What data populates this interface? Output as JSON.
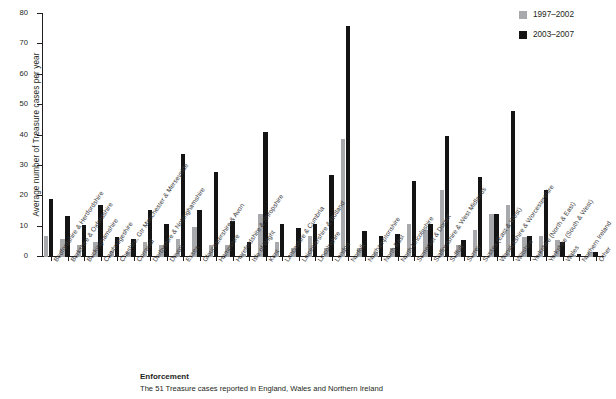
{
  "chart_data": {
    "type": "bar",
    "title": "",
    "xlabel": "",
    "ylabel": "Average number of Treasure cases per year",
    "ylim": [
      0,
      80
    ],
    "yticks": [
      0,
      10,
      20,
      30,
      40,
      50,
      60,
      70,
      80
    ],
    "grid": false,
    "legend_position": "top-right",
    "categories": [
      "Bedfordshire & Hertfordshire",
      "Berkshire & Oxfordshire",
      "Buckinghamshire",
      "Cambridgeshire",
      "Cheshire, Gtr Manchester & Merseyside",
      "Cornwall",
      "Derbyshire & Nottinghamshire",
      "Devon",
      "Essex",
      "Gloucestershire & Avon",
      "Hampshire",
      "Herefordshire & Shropshire",
      "Isle of Wight",
      "Kent",
      "Lancashire & Cumbria",
      "Leicestershire & Rutland",
      "Lincolnshire",
      "London",
      "Norfolk",
      "Northamptonshire",
      "North East",
      "North Lincolnshire",
      "Somerset & Dorset",
      "Staffordshire & West Midlands",
      "Suffolk",
      "Surrey",
      "Sussex (East & West)",
      "Warwickshire & Worcestershire",
      "Wiltshire",
      "Yorkshire (North & East)",
      "Yorkshire (South & West)",
      "Wales",
      "Northern Ireland",
      "Other"
    ],
    "series": [
      {
        "name": "1997–2002",
        "color": "#a7a9ac",
        "values": [
          7,
          6,
          4,
          5,
          2,
          1.5,
          5,
          4,
          6,
          10,
          4,
          4,
          1,
          14,
          5,
          3,
          7,
          3,
          39,
          3,
          1.5,
          3,
          11,
          9,
          22,
          4,
          9,
          14,
          17,
          6.5,
          7,
          5.5,
          0.7,
          1.5
        ]
      },
      {
        "name": "2003–2007",
        "color": "#141414",
        "values": [
          19,
          13.5,
          10.5,
          17,
          6.5,
          6,
          15.5,
          11,
          34,
          15.5,
          28,
          12,
          5,
          41,
          11,
          9.5,
          11,
          27,
          76,
          8.5,
          7,
          7.5,
          25,
          11,
          40,
          5.5,
          26.5,
          14,
          48,
          7,
          22,
          5,
          1,
          1.5
        ]
      }
    ]
  },
  "legend": {
    "items": [
      {
        "label": "1997–2002",
        "color": "#a7a9ac"
      },
      {
        "label": "2003–2007",
        "color": "#141414"
      }
    ]
  },
  "footer": {
    "heading": "Enforcement",
    "body": "The 51 Treasure cases reported in England, Wales and Northern Ireland"
  }
}
